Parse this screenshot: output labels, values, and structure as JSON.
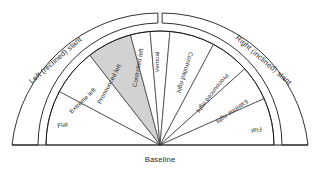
{
  "diagram": {
    "baseline_label": "Baseline",
    "center": {
      "x": 160,
      "y": 145
    },
    "inner_radius": 114,
    "band_inner_radius": 122,
    "band_outer_radius": 148,
    "colors": {
      "stroke": "#1a1a1a",
      "thin_stroke": "#3a3a3a",
      "highlight_fill": "#d2d2d2",
      "plain_fill": "#ffffff",
      "background": "#ffffff",
      "text": "#1f1f1f"
    },
    "bands": [
      {
        "id": "left-band",
        "label": "Left (reclined) slant",
        "side": "left",
        "start_angle": 182,
        "end_angle": 91
      },
      {
        "id": "right-band",
        "label": "Right (inclined) slant",
        "side": "right",
        "start_angle": 89,
        "end_angle": -2
      }
    ],
    "sectors": [
      {
        "id": "flat-left",
        "label": "Flat",
        "side": "left",
        "start_angle": 180,
        "end_angle": 152,
        "highlighted": false
      },
      {
        "id": "extreme-left",
        "label": "Extreme left",
        "side": "left",
        "start_angle": 152,
        "end_angle": 128,
        "highlighted": false
      },
      {
        "id": "pronounced-left",
        "label": "Pronounced left",
        "side": "left",
        "start_angle": 128,
        "end_angle": 105,
        "highlighted": true
      },
      {
        "id": "controlled-left",
        "label": "Controlled left",
        "side": "left",
        "start_angle": 105,
        "end_angle": 95,
        "highlighted": false
      },
      {
        "id": "vertical",
        "label": "Vertical",
        "side": "center",
        "start_angle": 95,
        "end_angle": 85,
        "highlighted": false
      },
      {
        "id": "controlled-right",
        "label": "Controlled right",
        "side": "right",
        "start_angle": 85,
        "end_angle": 62,
        "highlighted": false
      },
      {
        "id": "pronounced-right",
        "label": "Pronounced right",
        "side": "right",
        "start_angle": 62,
        "end_angle": 42,
        "highlighted": false
      },
      {
        "id": "extreme-right",
        "label": "Extreme right",
        "side": "right",
        "start_angle": 42,
        "end_angle": 24,
        "highlighted": false
      },
      {
        "id": "flat-right",
        "label": "Flat",
        "side": "right",
        "start_angle": 24,
        "end_angle": 0,
        "highlighted": false
      }
    ]
  }
}
